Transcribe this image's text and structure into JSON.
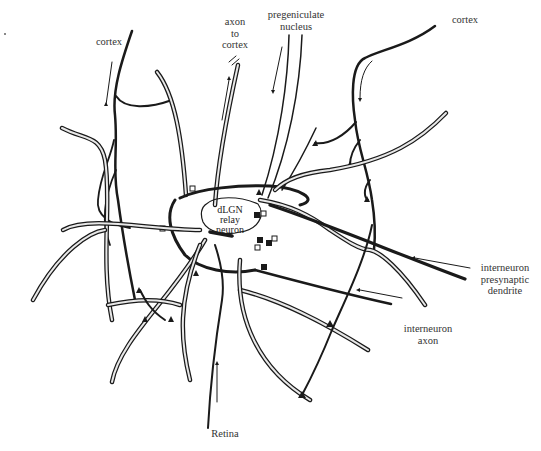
{
  "diagram": {
    "center": {
      "label": "dLGN\nrelay\nneuron"
    },
    "labels": [
      {
        "id": "cortex-left",
        "text": "cortex"
      },
      {
        "id": "axon-to-cortex",
        "text": "axon\nto\ncortex"
      },
      {
        "id": "pregeniculate-nucleus",
        "text": "pregeniculate\nnucleus"
      },
      {
        "id": "cortex-right",
        "text": "cortex"
      },
      {
        "id": "interneuron-presynaptic-dendrite",
        "text": "interneuron\npresynaptic\ndendrite"
      },
      {
        "id": "interneuron-axon",
        "text": "interneuron\naxon"
      },
      {
        "id": "retina",
        "text": "Retina"
      }
    ],
    "colors": {
      "line": "#1a1a1a",
      "text": "#333333",
      "background": "#ffffff"
    }
  }
}
